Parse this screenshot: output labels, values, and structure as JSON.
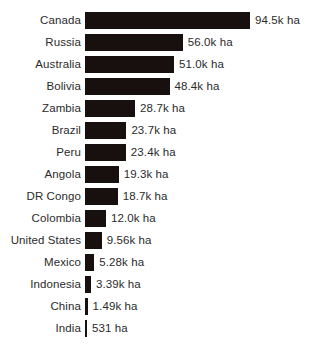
{
  "chart_data": {
    "type": "bar",
    "orientation": "horizontal",
    "title": "",
    "subtitle": "",
    "xlabel": "",
    "ylabel": "",
    "unit": "ha",
    "grid": false,
    "legend": false,
    "axis_visible": false,
    "xlim": [
      0,
      94500
    ],
    "bar_color": "#17100f",
    "text_color": "#2b2b2b",
    "background": "#ffffff",
    "categories": [
      "Canada",
      "Russia",
      "Australia",
      "Bolivia",
      "Zambia",
      "Brazil",
      "Peru",
      "Angola",
      "DR Congo",
      "Colombia",
      "United States",
      "Mexico",
      "Indonesia",
      "China",
      "India"
    ],
    "values": [
      94500,
      56000,
      51000,
      48400,
      28700,
      23700,
      23400,
      19300,
      18700,
      12000,
      9560,
      5280,
      3390,
      1490,
      531
    ],
    "value_labels": [
      "94.5k ha",
      "56.0k ha",
      "51.0k ha",
      "48.4k ha",
      "28.7k ha",
      "23.7k ha",
      "23.4k ha",
      "19.3k ha",
      "18.7k ha",
      "12.0k ha",
      "9.56k ha",
      "5.28k ha",
      "3.39k ha",
      "1.49k ha",
      "531 ha"
    ],
    "rows": [
      {
        "category": "Canada",
        "value": 94500,
        "value_label": "94.5k ha"
      },
      {
        "category": "Russia",
        "value": 56000,
        "value_label": "56.0k ha"
      },
      {
        "category": "Australia",
        "value": 51000,
        "value_label": "51.0k ha"
      },
      {
        "category": "Bolivia",
        "value": 48400,
        "value_label": "48.4k ha"
      },
      {
        "category": "Zambia",
        "value": 28700,
        "value_label": "28.7k ha"
      },
      {
        "category": "Brazil",
        "value": 23700,
        "value_label": "23.7k ha"
      },
      {
        "category": "Peru",
        "value": 23400,
        "value_label": "23.4k ha"
      },
      {
        "category": "Angola",
        "value": 19300,
        "value_label": "19.3k ha"
      },
      {
        "category": "DR Congo",
        "value": 18700,
        "value_label": "18.7k ha"
      },
      {
        "category": "Colombia",
        "value": 12000,
        "value_label": "12.0k ha"
      },
      {
        "category": "United States",
        "value": 9560,
        "value_label": "9.56k ha"
      },
      {
        "category": "Mexico",
        "value": 5280,
        "value_label": "5.28k ha"
      },
      {
        "category": "Indonesia",
        "value": 3390,
        "value_label": "3.39k ha"
      },
      {
        "category": "China",
        "value": 1490,
        "value_label": "1.49k ha"
      },
      {
        "category": "India",
        "value": 531,
        "value_label": "531 ha"
      }
    ]
  }
}
